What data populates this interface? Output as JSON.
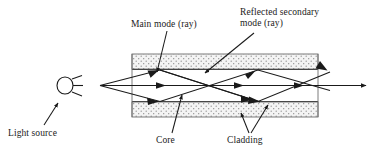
{
  "figure": {
    "type": "diagram",
    "width": 374,
    "height": 159,
    "background_color": "#ffffff",
    "line_color": "#1a1a1a",
    "cladding_fill": "#f2f2f2",
    "cladding_dot_color": "#7a7a7a"
  },
  "labels": {
    "main_mode": "Main mode (ray)",
    "reflected_secondary": "Reflected secondary\nmode (ray)",
    "reflected_secondary_line1": "Reflected secondary",
    "reflected_secondary_line2": "mode (ray)",
    "light_source": "Light source",
    "core": "Core",
    "cladding": "Cladding"
  },
  "components": {
    "light_source_icon": "lamp-circle-with-rays",
    "top_cladding_bar": "cladding-upper",
    "bottom_cladding_bar": "cladding-lower",
    "core_region": "core-channel",
    "rays": [
      "axial-ray",
      "upper-bounce-ray",
      "lower-bounce-ray",
      "secondary-reflected-ray"
    ]
  }
}
